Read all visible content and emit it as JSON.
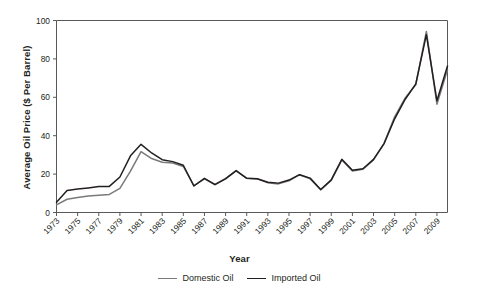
{
  "chart_data": {
    "type": "line",
    "title": "",
    "xlabel": "Year",
    "ylabel": "Average Oil Price ($ Per Barrel)",
    "xlim": [
      1973,
      2010
    ],
    "ylim": [
      0,
      100
    ],
    "grid": false,
    "legend_position": "bottom-center",
    "y_ticks": [
      0,
      20,
      40,
      60,
      80,
      100
    ],
    "x_ticks": [
      1973,
      1975,
      1977,
      1979,
      1981,
      1983,
      1985,
      1987,
      1989,
      1991,
      1993,
      1995,
      1997,
      1999,
      2001,
      2003,
      2005,
      2007,
      2009
    ],
    "x_tick_labels": [
      "1973",
      "1975",
      "1977",
      "1979",
      "1981",
      "1983",
      "1985",
      "1987",
      "1989",
      "1991",
      "1993",
      "1995",
      "1997",
      "1999",
      "2001",
      "2003",
      "2005",
      "2007",
      "2009"
    ],
    "x": [
      1973,
      1974,
      1975,
      1976,
      1977,
      1978,
      1979,
      1980,
      1981,
      1982,
      1983,
      1984,
      1985,
      1986,
      1987,
      1988,
      1989,
      1990,
      1991,
      1992,
      1993,
      1994,
      1995,
      1996,
      1997,
      1998,
      1999,
      2000,
      2001,
      2002,
      2003,
      2004,
      2005,
      2006,
      2007,
      2008,
      2009,
      2010
    ],
    "series": [
      {
        "name": "Domestic Oil",
        "color": "#7a7a7a",
        "values": [
          4.0,
          6.9,
          7.8,
          8.6,
          9.0,
          9.4,
          12.6,
          21.5,
          31.7,
          28.1,
          26.2,
          25.8,
          24.0,
          14.0,
          17.5,
          14.6,
          17.8,
          21.7,
          17.9,
          17.5,
          15.5,
          14.9,
          16.5,
          19.7,
          17.6,
          11.8,
          16.7,
          27.4,
          21.6,
          22.5,
          27.4,
          36.0,
          49.8,
          59.7,
          66.5,
          94.3,
          56.4,
          74.3
        ]
      },
      {
        "name": "Imported Oil",
        "color": "#231f20",
        "values": [
          5.3,
          11.5,
          12.2,
          12.8,
          13.5,
          13.6,
          18.5,
          29.5,
          35.5,
          31.0,
          27.5,
          26.5,
          24.6,
          13.8,
          17.8,
          14.5,
          17.5,
          21.8,
          17.8,
          17.6,
          15.8,
          15.3,
          16.9,
          19.7,
          17.9,
          12.0,
          17.0,
          27.7,
          22.0,
          22.8,
          27.7,
          35.9,
          48.8,
          59.0,
          67.0,
          92.6,
          58.2,
          76.3
        ]
      }
    ]
  },
  "axis_labels": {
    "x_title": "Year",
    "y_title": "Average Oil Price ($ Per Barrel)"
  },
  "legend": {
    "items": [
      {
        "label": "Domestic Oil",
        "color": "#7a7a7a"
      },
      {
        "label": "Imported Oil",
        "color": "#231f20"
      }
    ]
  }
}
